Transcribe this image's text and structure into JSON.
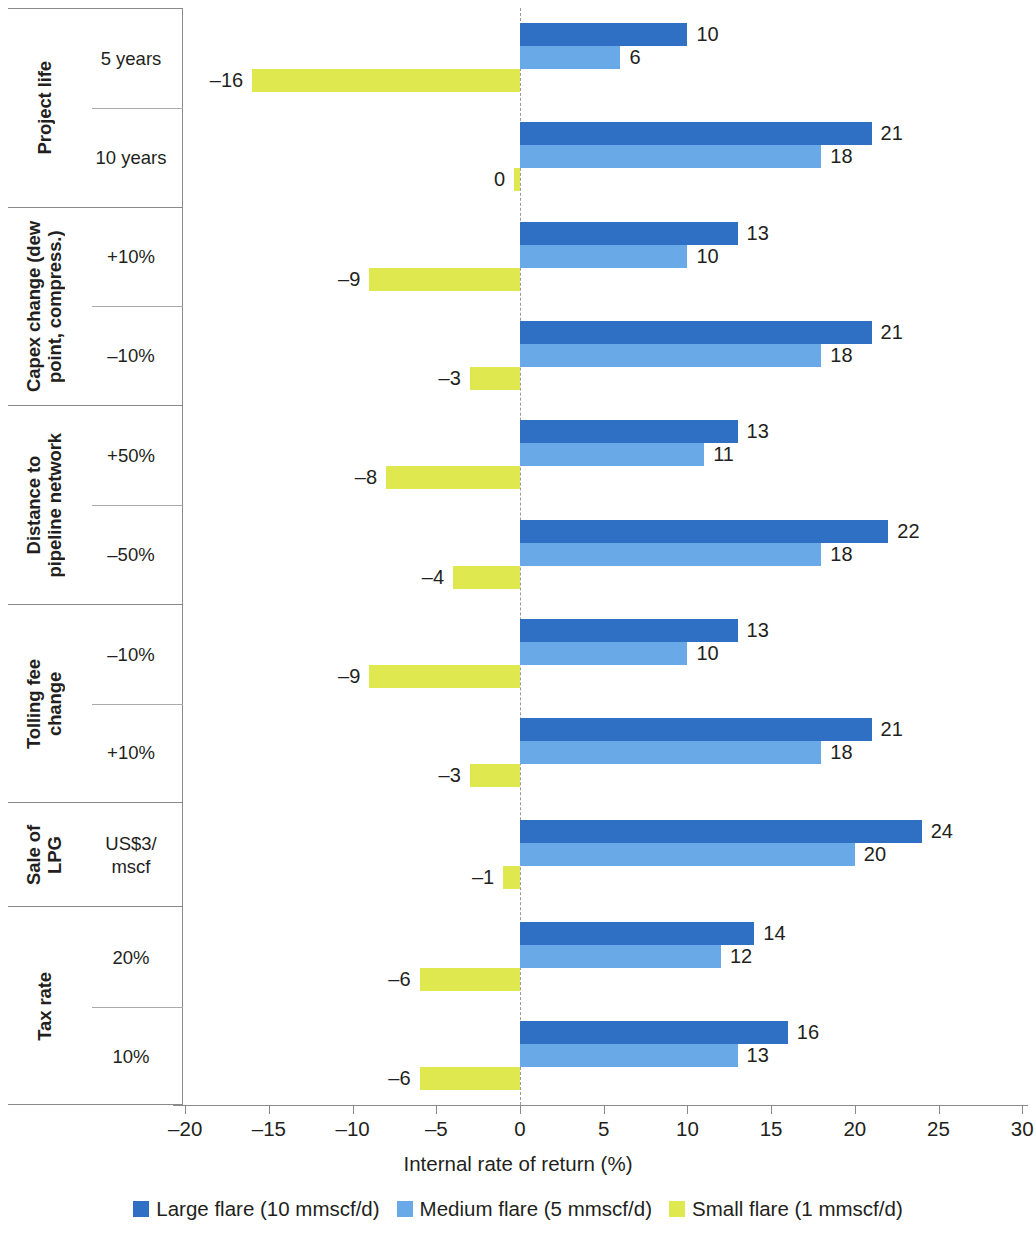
{
  "chart_data": {
    "type": "bar",
    "orientation": "horizontal",
    "title": "",
    "xlabel": "Internal rate of return (%)",
    "ylabel": "",
    "xlim": [
      -20,
      30
    ],
    "xticks": [
      -20,
      -15,
      -10,
      -5,
      0,
      5,
      10,
      15,
      20,
      25,
      30
    ],
    "xtick_labels": [
      "–20",
      "–15",
      "–10",
      "–5",
      "0",
      "5",
      "10",
      "15",
      "20",
      "25",
      "30"
    ],
    "grid": false,
    "zero_reference_line": true,
    "legend_position": "bottom",
    "series": [
      {
        "name": "Large flare (10 mmscf/d)",
        "color": "#2f6fc4",
        "values": [
          10,
          21,
          13,
          21,
          13,
          22,
          13,
          21,
          24,
          14,
          16
        ],
        "labels": [
          "10",
          "21",
          "13",
          "21",
          "13",
          "22",
          "13",
          "21",
          "24",
          "14",
          "16"
        ]
      },
      {
        "name": "Medium flare (5 mmscf/d)",
        "color": "#6aa9e8",
        "values": [
          6,
          18,
          10,
          18,
          11,
          18,
          10,
          18,
          20,
          12,
          13
        ],
        "labels": [
          "6",
          "18",
          "10",
          "18",
          "11",
          "18",
          "10",
          "18",
          "20",
          "12",
          "13"
        ]
      },
      {
        "name": "Small flare (1 mmscf/d)",
        "color": "#dfe94f",
        "values": [
          -16,
          -0.35,
          -9,
          -3,
          -8,
          -4,
          -9,
          -3,
          -1,
          -6,
          -6
        ],
        "labels": [
          "–16",
          "0",
          "–9",
          "–3",
          "–8",
          "–4",
          "–9",
          "–3",
          "–1",
          "–6",
          "–6"
        ]
      }
    ],
    "categories": [
      "5 years",
      "10 years",
      "+10%",
      "–10%",
      "+50%",
      "–50%",
      "–10%",
      "+10%",
      "US$3/\nmscf",
      "20%",
      "10%"
    ],
    "groups": [
      {
        "title": "Project life",
        "rows": [
          "5 years",
          "10 years"
        ]
      },
      {
        "title": "Capex change (dew\npoint, compress.)",
        "rows": [
          "+10%",
          "–10%"
        ]
      },
      {
        "title": "Distance to\npipeline network",
        "rows": [
          "+50%",
          "–50%"
        ]
      },
      {
        "title": "Tolling fee\nchange",
        "rows": [
          "–10%",
          "+10%"
        ]
      },
      {
        "title": "Sale of\nLPG",
        "rows": [
          "US$3/\nmscf"
        ]
      },
      {
        "title": "Tax rate",
        "rows": [
          "20%",
          "10%"
        ]
      }
    ]
  },
  "axis": {
    "title": "Internal rate of return (%)",
    "tick_labels": [
      "–20",
      "–15",
      "–10",
      "–5",
      "0",
      "5",
      "10",
      "15",
      "20",
      "25",
      "30"
    ]
  },
  "legend": {
    "items": [
      {
        "label": "Large flare (10 mmscf/d)",
        "color": "#2f6fc4"
      },
      {
        "label": "Medium flare (5 mmscf/d)",
        "color": "#6aa9e8"
      },
      {
        "label": "Small flare (1 mmscf/d)",
        "color": "#dfe94f"
      }
    ]
  },
  "colors": {
    "large_flare": "#2f6fc4",
    "medium_flare": "#6aa9e8",
    "small_flare": "#dfe94f",
    "rule": "#8a8a8a",
    "text": "#231f20"
  }
}
